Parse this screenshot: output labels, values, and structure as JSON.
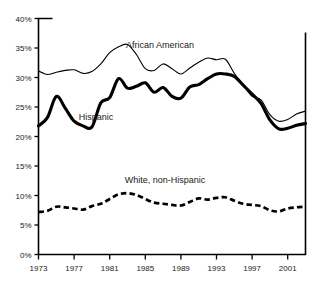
{
  "chart_data": {
    "type": "line",
    "title": "",
    "subtitle": "",
    "xlabel": "",
    "ylabel": "",
    "xlim": [
      1973,
      2003
    ],
    "ylim": [
      0,
      40
    ],
    "grid": false,
    "legend_position": "inline-annotations",
    "y_ticks": [
      "0%",
      "5%",
      "10%",
      "15%",
      "20%",
      "25%",
      "30%",
      "35%",
      "40%"
    ],
    "y_tick_values": [
      0,
      5,
      10,
      15,
      20,
      25,
      30,
      35,
      40
    ],
    "x_ticks": [
      "1973",
      "1977",
      "1981",
      "1985",
      "1989",
      "1993",
      "1997",
      "2001"
    ],
    "x_tick_values": [
      1973,
      1977,
      1981,
      1985,
      1989,
      1993,
      1997,
      2001
    ],
    "x": [
      1973,
      1974,
      1975,
      1976,
      1977,
      1978,
      1979,
      1980,
      1981,
      1982,
      1983,
      1984,
      1985,
      1986,
      1987,
      1988,
      1989,
      1990,
      1991,
      1992,
      1993,
      1994,
      1995,
      1996,
      1997,
      1998,
      1999,
      2000,
      2001,
      2002,
      2003
    ],
    "series": [
      {
        "name": "African American",
        "style": "thin-solid",
        "label": "African American",
        "color": "#000000",
        "values": [
          31.1,
          30.5,
          30.9,
          31.2,
          31.3,
          30.7,
          31.0,
          32.3,
          34.2,
          35.2,
          35.6,
          33.9,
          31.5,
          31.2,
          32.3,
          31.5,
          30.6,
          31.6,
          32.6,
          33.3,
          33.0,
          33.1,
          30.7,
          28.7,
          26.8,
          26.2,
          23.7,
          22.6,
          22.9,
          23.8,
          24.3
        ]
      },
      {
        "name": "Hispanic",
        "style": "thick-solid",
        "label": "Hispanic",
        "color": "#000000",
        "values": [
          21.8,
          23.2,
          26.8,
          24.8,
          22.6,
          21.8,
          21.6,
          25.7,
          26.6,
          29.8,
          28.2,
          28.5,
          29.1,
          27.5,
          28.3,
          26.8,
          26.5,
          28.4,
          28.8,
          29.8,
          30.6,
          30.6,
          30.2,
          28.7,
          27.2,
          25.6,
          22.8,
          21.3,
          21.4,
          21.9,
          22.2
        ]
      },
      {
        "name": "White, non-Hispanic",
        "style": "dashed",
        "label": "White, non-Hispanic",
        "color": "#000000",
        "values": [
          7.2,
          7.4,
          8.1,
          8.0,
          7.8,
          7.6,
          8.2,
          8.6,
          9.4,
          10.2,
          10.4,
          10.1,
          9.4,
          8.8,
          8.6,
          8.4,
          8.3,
          8.9,
          9.5,
          9.3,
          9.6,
          9.7,
          9.1,
          8.6,
          8.4,
          8.2,
          7.5,
          7.3,
          7.8,
          8.0,
          8.1
        ]
      }
    ],
    "annotations": [
      {
        "text": "African American",
        "x_px": 160,
        "y_px": 48
      },
      {
        "text": "Hispanic",
        "x_px": 96,
        "y_px": 120
      },
      {
        "text": "White, non-Hispanic",
        "x_px": 165,
        "y_px": 183
      }
    ]
  }
}
